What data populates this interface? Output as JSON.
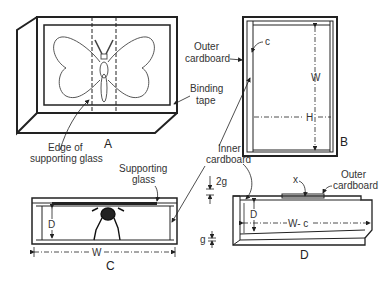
{
  "figure": {
    "panels": [
      {
        "id": "A",
        "label": "A",
        "description": "Butterfly mount box, perspective view"
      },
      {
        "id": "B",
        "label": "B",
        "description": "Top view of frame"
      },
      {
        "id": "C",
        "label": "C",
        "description": "Side cross-section"
      },
      {
        "id": "D",
        "label": "D",
        "description": "Detail of inner/outer cardboard"
      }
    ],
    "labels": {
      "outer_cardboard_1": "Outer",
      "outer_cardboard_2": "cardboard",
      "binding_tape_1": "Binding",
      "binding_tape_2": "tape",
      "edge_glass_1": "Edge of",
      "edge_glass_2": "supporting glass",
      "inner_cardboard_1": "Inner",
      "inner_cardboard_2": "cardboard",
      "supporting_glass_1": "Supporting",
      "supporting_glass_2": "glass",
      "outer_cardboard_d1": "Outer",
      "outer_cardboard_d2": "cardboard"
    },
    "dimensions": {
      "c": "c",
      "W_b": "W",
      "H": "H",
      "D_c": "D",
      "W_c": "W",
      "two_g": "2g",
      "x": "x",
      "D_d": "D",
      "W_minus_c": "W- c",
      "g": "g"
    }
  }
}
